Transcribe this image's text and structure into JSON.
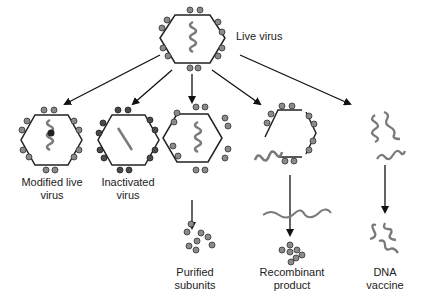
{
  "title": "Live virus",
  "colors": {
    "line": "#1a1a1a",
    "particle": "#8a8a8a",
    "particle_dark": "#4a4a4a",
    "genome": "#7a7a7a"
  },
  "vaccines": [
    {
      "label_1": "Modified live",
      "label_2": "virus"
    },
    {
      "label_1": "Inactivated",
      "label_2": "virus"
    },
    {
      "label_1": "Purified",
      "label_2": "subunits"
    },
    {
      "label_1": "Recombinant",
      "label_2": "product"
    },
    {
      "label_1": "DNA",
      "label_2": "vaccine"
    }
  ]
}
